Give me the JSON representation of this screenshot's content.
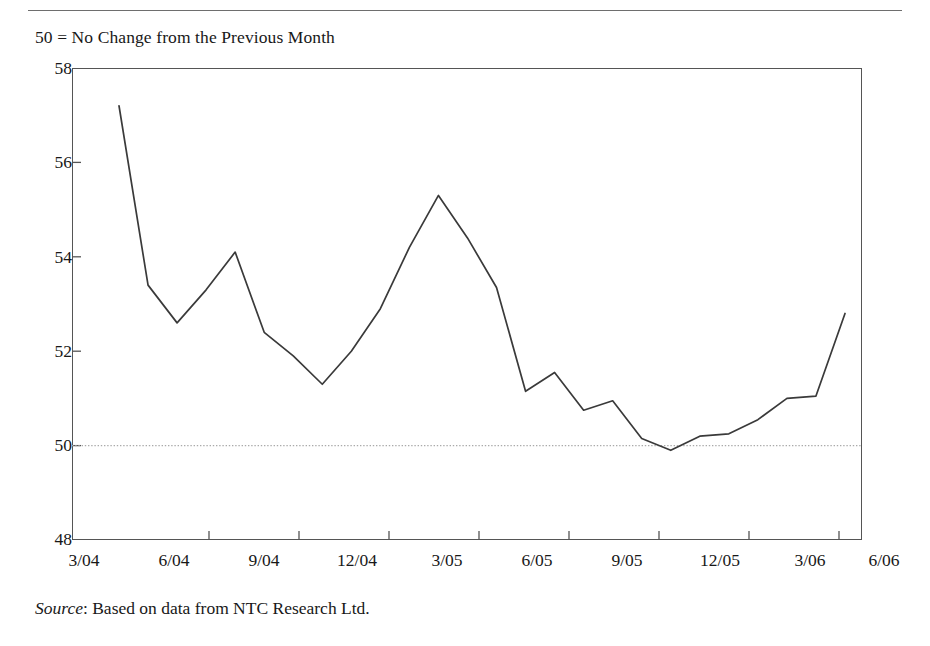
{
  "figure": {
    "legend_note": "50 = No Change from the Previous Month",
    "source_label": "Source",
    "source_text": ": Based on data from NTC Research Ltd."
  },
  "chart_data": {
    "type": "line",
    "title": "",
    "subtitle": "50 = No Change from the Previous Month",
    "xlabel": "",
    "ylabel": "",
    "xlim": [
      "3/04",
      "6/06"
    ],
    "ylim": [
      48,
      58
    ],
    "yticks": [
      48,
      50,
      52,
      54,
      56,
      58
    ],
    "ytick_labels": [
      "48",
      "50",
      "52",
      "54",
      "56",
      "58"
    ],
    "xticks": [
      "3/04",
      "6/04",
      "9/04",
      "12/04",
      "3/05",
      "6/05",
      "9/05",
      "12/05",
      "3/06",
      "6/06"
    ],
    "xtick_labels": [
      "3/04",
      "6/04",
      "9/04",
      "12/04",
      "3/05",
      "6/05",
      "9/05",
      "12/05",
      "3/06",
      "6/06"
    ],
    "grid": false,
    "legend": "none",
    "reference_line": {
      "value": 50,
      "style": "dotted",
      "label": "50 = No Change from the Previous Month"
    },
    "line_color": "#3a3a3a",
    "series": [
      {
        "name": "Eurozone Manufacturing PMI",
        "x": [
          "4/04",
          "5/04",
          "6/04",
          "7/04",
          "8/04",
          "9/04",
          "10/04",
          "11/04",
          "12/04",
          "1/05",
          "2/05",
          "3/05",
          "4/05",
          "5/05",
          "6/05",
          "7/05",
          "8/05",
          "9/05",
          "10/05",
          "11/05",
          "12/05",
          "1/06",
          "2/06",
          "3/06",
          "4/06",
          "5/06"
        ],
        "values": [
          57.2,
          53.4,
          52.6,
          53.3,
          54.1,
          52.4,
          51.9,
          51.3,
          52.0,
          52.9,
          54.2,
          55.3,
          54.4,
          53.35,
          51.15,
          51.55,
          50.75,
          50.95,
          50.15,
          49.9,
          50.2,
          50.25,
          50.55,
          51.0,
          51.05,
          52.8
        ]
      }
    ]
  },
  "axis_geometry": {
    "x_tick_positions": [
      119,
      209,
      299,
      389,
      479,
      569,
      659,
      749,
      839,
      862
    ],
    "y_tick_values": [
      58,
      56,
      54,
      52,
      50,
      48
    ]
  }
}
